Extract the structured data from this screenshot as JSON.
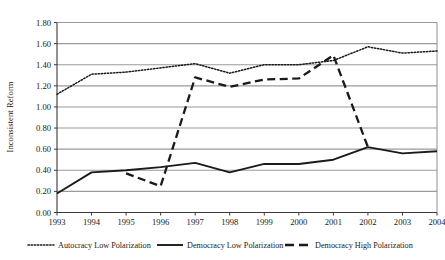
{
  "chart_data": {
    "type": "line",
    "title": "",
    "xlabel": "",
    "ylabel": "Inconsistent Reform",
    "x": [
      1993,
      1994,
      1995,
      1996,
      1997,
      1998,
      1999,
      2000,
      2001,
      2002,
      2003,
      2004
    ],
    "categories": [
      "1993",
      "1994",
      "1995",
      "1996",
      "1997",
      "1998",
      "1999",
      "2000",
      "2001",
      "2002",
      "2003",
      "2004"
    ],
    "ylim": [
      0.0,
      1.8
    ],
    "yticks": [
      "0.00",
      "0.20",
      "0.40",
      "0.60",
      "0.80",
      "1.00",
      "1.20",
      "1.40",
      "1.60",
      "1.80"
    ],
    "ytick_values": [
      0.0,
      0.2,
      0.4,
      0.6,
      0.8,
      1.0,
      1.2,
      1.4,
      1.6,
      1.8
    ],
    "grid": true,
    "grid_axis": "y",
    "legend_position": "bottom",
    "series": [
      {
        "name": "Autocracy Low Polarization",
        "style": "dotted",
        "color": "#1a1a1a",
        "x": [
          1993,
          1994,
          1995,
          1996,
          1997,
          1998,
          1999,
          2000,
          2001,
          2002,
          2003,
          2004
        ],
        "values": [
          1.12,
          1.31,
          1.33,
          1.37,
          1.41,
          1.32,
          1.4,
          1.4,
          1.44,
          1.57,
          1.51,
          1.53
        ]
      },
      {
        "name": "Democracy Low Polarization",
        "style": "solid",
        "color": "#1a1a1a",
        "x": [
          1993,
          1994,
          1995,
          1996,
          1997,
          1998,
          1999,
          2000,
          2001,
          2002,
          2003,
          2004
        ],
        "values": [
          0.18,
          0.38,
          0.4,
          0.43,
          0.47,
          0.38,
          0.46,
          0.46,
          0.5,
          0.62,
          0.56,
          0.58
        ]
      },
      {
        "name": "Democracy High Polarization",
        "style": "dashed",
        "color": "#1a1a1a",
        "x": [
          1995,
          1996,
          1997,
          1998,
          1999,
          2000,
          2001,
          2002
        ],
        "values": [
          0.37,
          0.25,
          1.28,
          1.19,
          1.26,
          1.27,
          1.49,
          0.62
        ]
      }
    ]
  },
  "axis": {
    "y_title": "Inconsistent Reform",
    "y_ticks": [
      "1.80",
      "1.60",
      "1.40",
      "1.20",
      "1.00",
      "0.80",
      "0.60",
      "0.40",
      "0.20",
      "0.00"
    ],
    "x_ticks": [
      "1993",
      "1994",
      "1995",
      "1996",
      "1997",
      "1998",
      "1999",
      "2000",
      "2001",
      "2002",
      "2003",
      "2004"
    ]
  },
  "legend": {
    "items": [
      {
        "label": "Autocracy Low Polarization",
        "style": "dotted"
      },
      {
        "label": "Democracy Low Polarization",
        "style": "solid"
      },
      {
        "label": "Democracy High Polarization",
        "style": "dashed"
      }
    ]
  },
  "colors": {
    "line": "#1a1a1a",
    "grid": "#9a9a9a",
    "frame": "#555555",
    "background": "#ffffff"
  }
}
